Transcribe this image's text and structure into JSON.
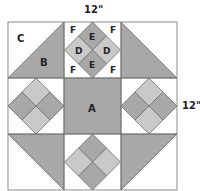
{
  "diagram": {
    "type": "quilt-block",
    "dimensions": {
      "top_label": "12\"",
      "right_label": "12\""
    },
    "piece_labels": {
      "A": "A",
      "B": "B",
      "C": "C",
      "D": "D",
      "E": "E",
      "F": "F"
    },
    "colors": {
      "background": "#ffffff",
      "dark": "#a8a8a8",
      "light": "#c9c9c9",
      "outline": "#6e6e6e"
    }
  }
}
